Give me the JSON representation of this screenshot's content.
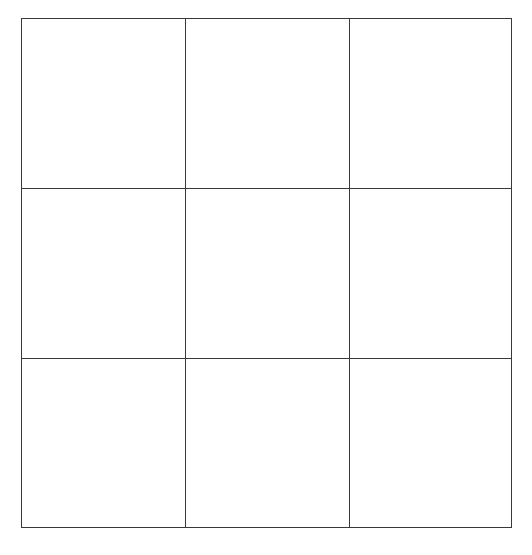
{
  "board": {
    "rows": 3,
    "cols": 3,
    "cells": [
      [
        "",
        "",
        ""
      ],
      [
        "",
        "",
        ""
      ],
      [
        "",
        "",
        ""
      ]
    ],
    "line_color": "#3a3a3a",
    "background_color": "#ffffff"
  }
}
